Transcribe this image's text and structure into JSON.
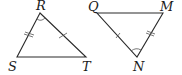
{
  "diagram": {
    "triangle1": {
      "vertices": {
        "R": "R",
        "S": "S",
        "T": "T"
      },
      "marks": {
        "RS": "double tick",
        "RT": "single tick",
        "angle_R": "arc"
      }
    },
    "triangle2": {
      "vertices": {
        "Q": "Q",
        "M": "M",
        "N": "N"
      },
      "marks": {
        "QN": "single tick",
        "MN": "double tick",
        "angle_N": "arc"
      }
    },
    "colors": {
      "line": "#2a2a2a",
      "background": "#ffffff"
    }
  }
}
